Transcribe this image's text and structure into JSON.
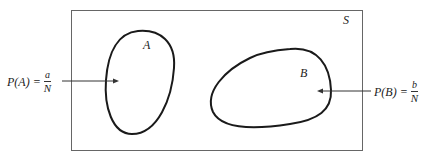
{
  "diagram": {
    "sample_space_label": "S",
    "events": [
      {
        "label": "A",
        "probability_lhs": "P(A) =",
        "numerator": "a",
        "denominator": "N"
      },
      {
        "label": "B",
        "probability_lhs": "P(B) =",
        "numerator": "b",
        "denominator": "N"
      }
    ],
    "colors": {
      "stroke": "#1a1a1a",
      "frame": "#555555",
      "background": "#ffffff"
    }
  }
}
